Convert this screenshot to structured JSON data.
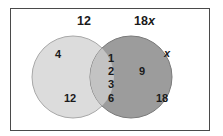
{
  "diagram": {
    "type": "venn",
    "sets": [
      {
        "label": "12",
        "only_elements": [
          "4",
          "12"
        ],
        "color": "#dcdcdc"
      },
      {
        "label": "18x",
        "only_elements": [
          "x",
          "9",
          "18"
        ],
        "color": "#9c9c9c"
      }
    ],
    "intersection": [
      "1",
      "2",
      "3",
      "6"
    ],
    "intersection_color": "#c3c3c3",
    "border_color": "#4a4a4a"
  }
}
